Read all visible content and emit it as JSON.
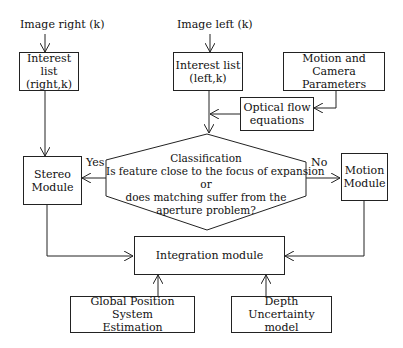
{
  "diagram": {
    "inputs": {
      "image_right": "Image right (k)",
      "image_left": "Image left (k)"
    },
    "boxes": {
      "interest_right": [
        "Interest list",
        "(right,k)"
      ],
      "interest_left": [
        "Interest list",
        "(left,k)"
      ],
      "motion_camera": [
        "Motion and Camera",
        "Parameters"
      ],
      "optical_flow": [
        "Optical flow",
        "equations"
      ],
      "stereo": [
        "Stereo",
        "Module"
      ],
      "motion": [
        "Motion",
        "Module"
      ],
      "integration": [
        "Integration module"
      ],
      "gps": [
        "Global Position System",
        "Estimation"
      ],
      "depth": [
        "Depth Uncertainty",
        "model"
      ]
    },
    "decision": {
      "lines": [
        "Classification",
        "Is feature close to the focus of expansion",
        "or",
        "does matching suffer from the",
        "aperture problem?"
      ],
      "yes_label": "Yes",
      "no_label": "No"
    }
  }
}
